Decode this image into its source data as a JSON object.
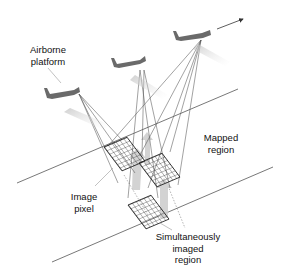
{
  "diagram": {
    "labels": {
      "airborne_platform": [
        "Airborne",
        "platform"
      ],
      "mapped_region": [
        "Mapped",
        "region"
      ],
      "image_pixel": [
        "Image",
        "pixel"
      ],
      "simultaneously_imaged_region": [
        "Simultaneously",
        "imaged",
        "region"
      ]
    },
    "elements": {
      "platforms": [
        "aircraft-left",
        "aircraft-middle",
        "aircraft-right"
      ],
      "flight_direction": "arrow pointing up-right",
      "pixel_grids": 3
    },
    "colors": {
      "line": "#444444",
      "grid": "#222222",
      "arrow_fill": "#cccccc",
      "aircraft": "#6a6a6a"
    }
  }
}
